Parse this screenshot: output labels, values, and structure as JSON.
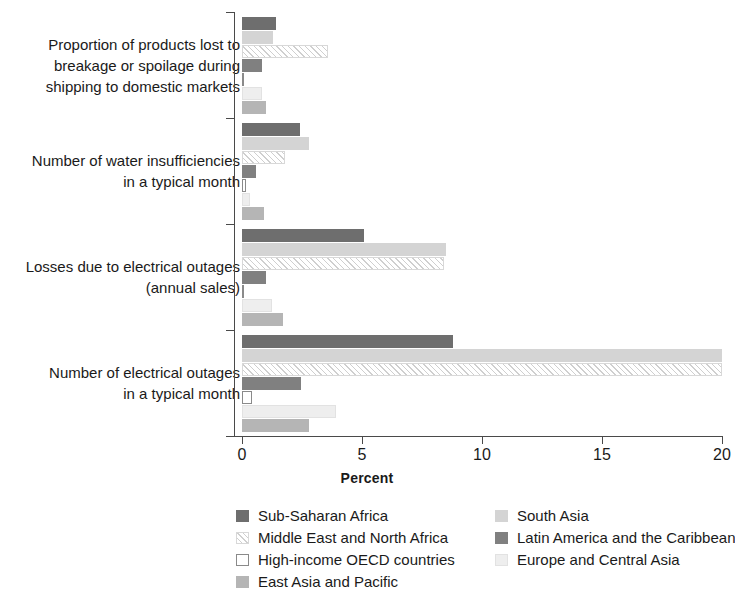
{
  "chart_data": {
    "type": "bar",
    "orientation": "horizontal",
    "title": "",
    "xlabel": "Percent",
    "ylabel": "",
    "xlim": [
      0,
      20
    ],
    "xticks": [
      0,
      5,
      10,
      15,
      20
    ],
    "xtick_labels": [
      "0",
      "5",
      "10",
      "15",
      "20"
    ],
    "grid": false,
    "legend_position": "bottom",
    "categories": [
      "Proportion of products lost to breakage or spoilage during shipping to domestic markets",
      "Number of water insufficiencies in a typical month",
      "Losses due to electrical outages (annual sales)",
      "Number of electrical outages in a typical month"
    ],
    "category_lines": [
      [
        "Proportion of products lost to",
        "breakage or spoilage during",
        "shipping to domestic markets"
      ],
      [
        "Number of water insufficiencies",
        "in a typical month"
      ],
      [
        "Losses due to electrical outages",
        "(annual sales)"
      ],
      [
        "Number of electrical outages",
        "in a typical month"
      ]
    ],
    "series": [
      {
        "name": "Sub-Saharan Africa",
        "color": "#6e6e6e",
        "pattern": "solid",
        "values": [
          1.4,
          2.4,
          5.1,
          8.8
        ]
      },
      {
        "name": "South Asia",
        "color": "#d4d4d4",
        "pattern": "solid",
        "values": [
          1.3,
          2.8,
          8.5,
          20.0
        ]
      },
      {
        "name": "Middle East and North Africa",
        "color": "#fdfdfd",
        "pattern": "diagonal-hatch",
        "values": [
          3.6,
          1.8,
          8.4,
          20.0
        ]
      },
      {
        "name": "Latin America and the Caribbean",
        "color": "#808080",
        "pattern": "solid",
        "values": [
          0.85,
          0.6,
          1.0,
          2.45
        ]
      },
      {
        "name": "High-income OECD countries",
        "color": "#ffffff",
        "pattern": "outline",
        "values": [
          0.1,
          0.15,
          0.1,
          0.4
        ]
      },
      {
        "name": "Europe and Central Asia",
        "color": "#eeeeee",
        "pattern": "solid",
        "values": [
          0.85,
          0.35,
          1.25,
          3.9
        ]
      },
      {
        "name": "East Asia and Pacific",
        "color": "#b5b5b5",
        "pattern": "solid",
        "values": [
          1.0,
          0.9,
          1.7,
          2.8
        ]
      }
    ],
    "legend_columns": [
      [
        "Sub-Saharan Africa",
        "Middle East and North Africa",
        "High-income OECD countries",
        "East Asia and Pacific"
      ],
      [
        "South Asia",
        "Latin America and the Caribbean",
        "Europe and Central Asia"
      ]
    ]
  },
  "axis": {
    "x_title": "Percent"
  }
}
